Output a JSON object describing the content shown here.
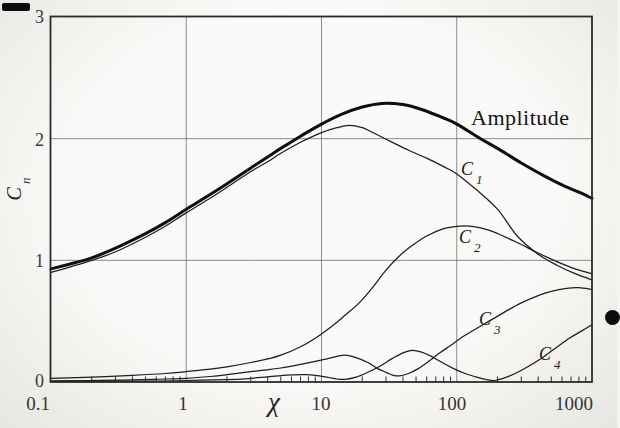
{
  "figure": {
    "y_axis_title": {
      "main": "C",
      "sub": "n"
    },
    "x_axis_title": "χ"
  },
  "labels": {
    "amplitude": "Amplitude",
    "c1": {
      "main": "C",
      "sub": "1"
    },
    "c2": {
      "main": "C",
      "sub": "2"
    },
    "c3": {
      "main": "C",
      "sub": "3"
    },
    "c4": {
      "main": "C",
      "sub": "4"
    }
  },
  "chart_data": {
    "type": "line",
    "title": "",
    "xlabel": "χ",
    "ylabel": "Cn",
    "x_axis": {
      "scale": "log",
      "min": 0.1,
      "max": 1000,
      "label": "χ",
      "tick_labels": [
        "0.1",
        "1",
        "10",
        "100",
        "1000"
      ]
    },
    "y_axis": {
      "scale": "linear",
      "min": 0,
      "max": 3,
      "label": "Cn",
      "tick_labels": [
        "0",
        "1",
        "2",
        "3"
      ]
    },
    "grid": {
      "x_gridlines": [
        1,
        10,
        100
      ],
      "y_gridlines": [
        1,
        2
      ]
    },
    "legend": "labels drawn next to curves",
    "series": [
      {
        "name": "Amplitude",
        "style": "thick",
        "points": [
          [
            0.1,
            0.93
          ],
          [
            0.15,
            0.98
          ],
          [
            0.2,
            1.02
          ],
          [
            0.3,
            1.1
          ],
          [
            0.5,
            1.22
          ],
          [
            0.7,
            1.31
          ],
          [
            1,
            1.42
          ],
          [
            1.5,
            1.54
          ],
          [
            2,
            1.63
          ],
          [
            3,
            1.76
          ],
          [
            4,
            1.85
          ],
          [
            5,
            1.92
          ],
          [
            7,
            2.02
          ],
          [
            10,
            2.12
          ],
          [
            14,
            2.2
          ],
          [
            20,
            2.26
          ],
          [
            28,
            2.29
          ],
          [
            40,
            2.28
          ],
          [
            55,
            2.24
          ],
          [
            80,
            2.17
          ],
          [
            100,
            2.12
          ],
          [
            150,
            2.0
          ],
          [
            200,
            1.92
          ],
          [
            300,
            1.8
          ],
          [
            450,
            1.69
          ],
          [
            600,
            1.62
          ],
          [
            800,
            1.56
          ],
          [
            1000,
            1.51
          ]
        ]
      },
      {
        "name": "C1",
        "style": "thin",
        "points": [
          [
            0.1,
            0.9
          ],
          [
            0.2,
            1.0
          ],
          [
            0.3,
            1.07
          ],
          [
            0.5,
            1.19
          ],
          [
            0.7,
            1.28
          ],
          [
            1,
            1.39
          ],
          [
            1.5,
            1.51
          ],
          [
            2,
            1.6
          ],
          [
            3,
            1.73
          ],
          [
            4,
            1.81
          ],
          [
            5,
            1.88
          ],
          [
            7,
            1.97
          ],
          [
            10,
            2.05
          ],
          [
            13,
            2.09
          ],
          [
            16,
            2.11
          ],
          [
            20,
            2.09
          ],
          [
            25,
            2.04
          ],
          [
            32,
            1.98
          ],
          [
            45,
            1.9
          ],
          [
            60,
            1.84
          ],
          [
            80,
            1.77
          ],
          [
            100,
            1.71
          ],
          [
            140,
            1.58
          ],
          [
            200,
            1.42
          ],
          [
            280,
            1.2
          ],
          [
            400,
            1.05
          ],
          [
            550,
            0.96
          ],
          [
            750,
            0.89
          ],
          [
            1000,
            0.84
          ]
        ]
      },
      {
        "name": "C2",
        "style": "thin",
        "points": [
          [
            0.1,
            0.03
          ],
          [
            0.2,
            0.04
          ],
          [
            0.4,
            0.055
          ],
          [
            0.7,
            0.07
          ],
          [
            1,
            0.085
          ],
          [
            1.5,
            0.105
          ],
          [
            2,
            0.125
          ],
          [
            3,
            0.16
          ],
          [
            4,
            0.19
          ],
          [
            5,
            0.22
          ],
          [
            7,
            0.29
          ],
          [
            9,
            0.36
          ],
          [
            12,
            0.46
          ],
          [
            15,
            0.55
          ],
          [
            19,
            0.65
          ],
          [
            24,
            0.78
          ],
          [
            30,
            0.92
          ],
          [
            38,
            1.04
          ],
          [
            48,
            1.13
          ],
          [
            60,
            1.2
          ],
          [
            80,
            1.26
          ],
          [
            100,
            1.28
          ],
          [
            130,
            1.28
          ],
          [
            170,
            1.25
          ],
          [
            220,
            1.2
          ],
          [
            300,
            1.13
          ],
          [
            400,
            1.06
          ],
          [
            550,
            0.99
          ],
          [
            750,
            0.93
          ],
          [
            1000,
            0.89
          ]
        ]
      },
      {
        "name": "C3",
        "style": "thin",
        "points": [
          [
            0.1,
            0.01
          ],
          [
            0.3,
            0.015
          ],
          [
            0.7,
            0.025
          ],
          [
            1,
            0.03
          ],
          [
            1.5,
            0.045
          ],
          [
            2,
            0.06
          ],
          [
            3,
            0.085
          ],
          [
            4,
            0.1
          ],
          [
            5,
            0.115
          ],
          [
            7,
            0.145
          ],
          [
            9,
            0.17
          ],
          [
            11,
            0.19
          ],
          [
            13,
            0.21
          ],
          [
            15,
            0.22
          ],
          [
            18,
            0.2
          ],
          [
            22,
            0.16
          ],
          [
            26,
            0.11
          ],
          [
            30,
            0.08
          ],
          [
            34,
            0.055
          ],
          [
            38,
            0.05
          ],
          [
            44,
            0.07
          ],
          [
            52,
            0.11
          ],
          [
            62,
            0.17
          ],
          [
            75,
            0.24
          ],
          [
            90,
            0.3
          ],
          [
            110,
            0.37
          ],
          [
            140,
            0.44
          ],
          [
            180,
            0.51
          ],
          [
            230,
            0.58
          ],
          [
            300,
            0.65
          ],
          [
            400,
            0.71
          ],
          [
            500,
            0.745
          ],
          [
            650,
            0.77
          ],
          [
            800,
            0.775
          ],
          [
            1000,
            0.76
          ]
        ]
      },
      {
        "name": "C4",
        "style": "thin",
        "points": [
          [
            0.1,
            0.005
          ],
          [
            0.5,
            0.008
          ],
          [
            1,
            0.012
          ],
          [
            2,
            0.02
          ],
          [
            3,
            0.03
          ],
          [
            4,
            0.042
          ],
          [
            5,
            0.052
          ],
          [
            6,
            0.058
          ],
          [
            7.5,
            0.06
          ],
          [
            9,
            0.055
          ],
          [
            11,
            0.04
          ],
          [
            13,
            0.025
          ],
          [
            15,
            0.022
          ],
          [
            18,
            0.04
          ],
          [
            22,
            0.08
          ],
          [
            27,
            0.13
          ],
          [
            33,
            0.19
          ],
          [
            40,
            0.24
          ],
          [
            47,
            0.26
          ],
          [
            55,
            0.245
          ],
          [
            65,
            0.21
          ],
          [
            78,
            0.16
          ],
          [
            95,
            0.11
          ],
          [
            115,
            0.07
          ],
          [
            140,
            0.04
          ],
          [
            165,
            0.02
          ],
          [
            190,
            0.012
          ],
          [
            220,
            0.03
          ],
          [
            270,
            0.07
          ],
          [
            340,
            0.13
          ],
          [
            430,
            0.2
          ],
          [
            540,
            0.28
          ],
          [
            680,
            0.36
          ],
          [
            840,
            0.42
          ],
          [
            1000,
            0.47
          ]
        ]
      }
    ]
  }
}
